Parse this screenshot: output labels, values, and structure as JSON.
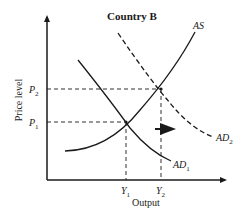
{
  "title": "Country B",
  "axes": {
    "ylabel": "Price level",
    "xlabel": "Output"
  },
  "ticks": {
    "y": [
      {
        "label": "P",
        "sub": "2"
      },
      {
        "label": "P",
        "sub": "1"
      }
    ],
    "x": [
      {
        "label": "Y",
        "sub": "1"
      },
      {
        "label": "Y",
        "sub": "2"
      }
    ]
  },
  "curves": {
    "as": {
      "label": "AS",
      "style": "solid"
    },
    "ad1": {
      "label": "AD",
      "sub": "1",
      "style": "solid"
    },
    "ad2": {
      "label": "AD",
      "sub": "2",
      "style": "dashed"
    }
  },
  "annotation": {
    "arrow": "right",
    "meaning": "AD shifts right from AD1 to AD2"
  },
  "colors": {
    "line": "#1a1a1a",
    "background": "#ffffff"
  }
}
